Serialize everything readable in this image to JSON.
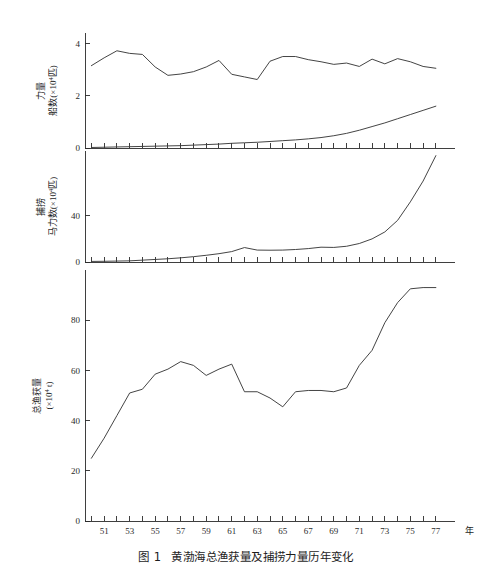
{
  "figure": {
    "caption_number": "图 1",
    "caption_text": "黄渤海总渔获量及捕捞力量历年变化",
    "xaxis_unit": "年",
    "background": "#ffffff",
    "line_color": "#3a3a3a"
  },
  "chart_data": {
    "type": "line",
    "title": "黄渤海总渔获量及捕捞力量历年变化",
    "xlabel": "年",
    "grid": false,
    "legend": "none",
    "x_tick_labels": [
      "51",
      "53",
      "55",
      "57",
      "59",
      "61",
      "63",
      "65",
      "67",
      "69",
      "71",
      "73",
      "75",
      "77"
    ],
    "x_tick_values": [
      51,
      53,
      55,
      57,
      59,
      61,
      63,
      65,
      67,
      69,
      71,
      73,
      75,
      77
    ],
    "x": [
      50,
      51,
      52,
      53,
      54,
      55,
      56,
      57,
      58,
      59,
      60,
      61,
      62,
      63,
      64,
      65,
      66,
      67,
      68,
      69,
      70,
      71,
      72,
      73,
      74,
      75,
      76,
      77
    ],
    "xlim": [
      49.5,
      78.5
    ],
    "panels": [
      {
        "id": "panel-fishing-power",
        "ylabel_top": "力量",
        "ylabel_bottom": "船数(×10⁴匹)",
        "ylabel_unit_base": "船数(×10",
        "ylabel_unit_exp": "4",
        "ylabel_unit_tail": "匹)",
        "ylim": [
          0,
          4.4
        ],
        "y_tick_labels": [
          "0",
          "2",
          "4"
        ],
        "y_tick_values": [
          0,
          2,
          4
        ],
        "series": [
          {
            "name": "船数",
            "values": [
              3.15,
              3.45,
              3.72,
              3.62,
              3.58,
              3.1,
              2.78,
              2.83,
              2.92,
              3.1,
              3.35,
              2.82,
              2.72,
              2.62,
              3.32,
              3.5,
              3.5,
              3.38,
              3.3,
              3.2,
              3.25,
              3.12,
              3.4,
              3.22,
              3.42,
              3.3,
              3.12,
              3.05
            ]
          },
          {
            "name": "马力数",
            "values": [
              0.02,
              0.03,
              0.04,
              0.05,
              0.06,
              0.07,
              0.08,
              0.09,
              0.11,
              0.13,
              0.15,
              0.18,
              0.2,
              0.22,
              0.25,
              0.28,
              0.31,
              0.35,
              0.4,
              0.47,
              0.56,
              0.68,
              0.82,
              0.96,
              1.12,
              1.28,
              1.44,
              1.6
            ]
          }
        ]
      },
      {
        "id": "panel-fishing-effort",
        "ylabel_top": "捕捞",
        "ylabel_bottom": "马力数(×10⁴匹)",
        "ylabel_unit_base": "马力数(×10",
        "ylabel_unit_exp": "4",
        "ylabel_unit_tail": "匹)",
        "ylim": [
          0,
          96
        ],
        "y_tick_labels": [
          "0",
          "40"
        ],
        "y_tick_values": [
          0,
          40
        ],
        "series": [
          {
            "name": "马力数",
            "values": [
              0.5,
              0.6,
              0.8,
              1.0,
              1.6,
              2.2,
              2.8,
              3.6,
              4.6,
              5.8,
              7.2,
              9.0,
              12.5,
              10.3,
              10.2,
              10.3,
              10.8,
              11.6,
              12.8,
              12.6,
              13.6,
              16.0,
              20.0,
              26.0,
              36.0,
              52.0,
              70.0,
              92.0
            ]
          }
        ]
      },
      {
        "id": "panel-total-catch",
        "ylabel_top": "总渔获量",
        "ylabel_bottom": "(×10⁴ t)",
        "ylabel_unit_base": "(×10",
        "ylabel_unit_exp": "4",
        "ylabel_unit_tail": " t)",
        "ylim": [
          0,
          100
        ],
        "y_tick_labels": [
          "0",
          "20",
          "40",
          "60",
          "80"
        ],
        "y_tick_values": [
          0,
          20,
          40,
          60,
          80
        ],
        "series": [
          {
            "name": "总渔获量",
            "values": [
              25.0,
              33.0,
              42.0,
              51.0,
              52.5,
              58.5,
              60.5,
              63.5,
              62.0,
              58.0,
              60.5,
              62.5,
              51.5,
              51.5,
              49.0,
              45.5,
              51.5,
              52.0,
              52.0,
              51.5,
              53.0,
              62.0,
              68.0,
              79.0,
              87.0,
              92.5,
              93.0,
              93.0
            ]
          }
        ]
      }
    ]
  }
}
